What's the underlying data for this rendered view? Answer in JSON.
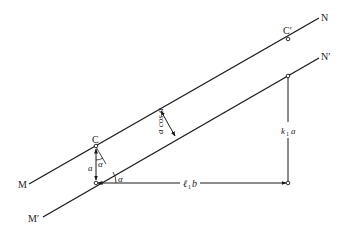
{
  "diagram": {
    "lines": {
      "upper": {
        "start_label": "M",
        "end_label": "N"
      },
      "lower": {
        "start_label": "M′",
        "end_label": "N′"
      }
    },
    "points": {
      "c": "C",
      "c_prime": "C′"
    },
    "labels": {
      "perpendicular_distance": "a cos α",
      "vertical_offset": "a",
      "angle_at_c": "α",
      "angle_at_base": "α",
      "horizontal_distance_l": "ℓ",
      "horizontal_distance_sub": "1",
      "horizontal_distance_b": "b",
      "vertical_distance_k": "k",
      "vertical_distance_sub": "1",
      "vertical_distance_a": "a"
    },
    "colors": {
      "line": "#1a1a1a",
      "background": "#ffffff"
    }
  }
}
